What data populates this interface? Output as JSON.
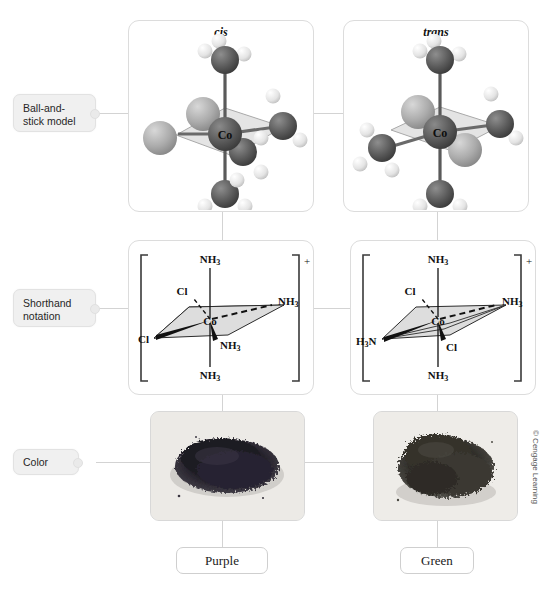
{
  "figure": {
    "title_left": "cis",
    "title_right": "trans",
    "copyright": "© Cengage Learning"
  },
  "row_labels": [
    {
      "id": "ball-and-stick",
      "text": "Ball-and-stick model"
    },
    {
      "id": "shorthand",
      "text": "Shorthand notation"
    },
    {
      "id": "color",
      "text": "Color"
    }
  ],
  "columns": [
    {
      "isomer": "cis",
      "header": "cis",
      "color_name": "Purple",
      "shorthand": {
        "center": "Co",
        "charge": "+",
        "ligand_top": "NH₃",
        "ligand_upper_left": "Cl",
        "ligand_right": "NH₃",
        "ligand_left": "Cl",
        "ligand_lower_center": "NH₃",
        "ligand_bottom": "NH₃"
      },
      "model": {
        "center_label": "Co",
        "chlorine_positions": [
          "back-left",
          "front-left"
        ],
        "ammine_positions": [
          "top",
          "right",
          "front-right",
          "bottom"
        ]
      }
    },
    {
      "isomer": "trans",
      "header": "trans",
      "color_name": "Green",
      "shorthand": {
        "center": "Co",
        "charge": "+",
        "ligand_top": "NH₃",
        "ligand_upper_left": "Cl",
        "ligand_right": "NH₃",
        "ligand_left": "H₃N",
        "ligand_lower_center": "Cl",
        "ligand_bottom": "NH₃"
      },
      "model": {
        "center_label": "Co",
        "chlorine_positions": [
          "back-left",
          "front-right"
        ],
        "ammine_positions": [
          "top",
          "right",
          "left",
          "bottom"
        ]
      }
    }
  ],
  "colors": {
    "panel_border": "#dcdcdc",
    "label_fill": "#f0f0f0",
    "connector": "#d3d3d3",
    "cobalt": "#5a5a5a",
    "nitrogen": "#555555",
    "chlorine": "#a8a8a8",
    "hydrogen": "#e8e8e8",
    "plane_fill": "#dddddd"
  }
}
